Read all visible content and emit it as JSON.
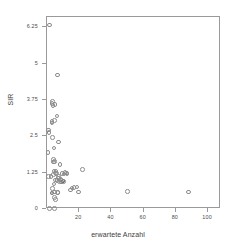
{
  "chart_data": {
    "type": "scatter",
    "title": "",
    "xlabel": "erwartete Anzahl",
    "ylabel": "SIR",
    "xlim": [
      0,
      108
    ],
    "ylim": [
      0,
      6.6
    ],
    "grid": false,
    "legend": null,
    "xticks": [
      20,
      40,
      60,
      80,
      100
    ],
    "yticks": [
      0,
      1.25,
      2.5,
      3.75,
      5,
      6.25
    ],
    "xtick_labels": [
      "20",
      "40",
      "60",
      "80",
      "100"
    ],
    "ytick_labels": [
      "0",
      "1.25",
      "2.5",
      "3.75",
      "5",
      "6.25"
    ],
    "marker": "open-circle",
    "marker_color": "#8c8c8c",
    "points": [
      {
        "x": 1.6,
        "y": 6.32,
        "emph": false
      },
      {
        "x": 1.0,
        "y": 2.72,
        "emph": false
      },
      {
        "x": 1.3,
        "y": 2.62,
        "emph": false
      },
      {
        "x": 0.6,
        "y": 1.95,
        "emph": false
      },
      {
        "x": 1.1,
        "y": 1.12,
        "emph": false
      },
      {
        "x": 2.6,
        "y": 1.12,
        "emph": false
      },
      {
        "x": 3.1,
        "y": 3.62,
        "emph": false
      },
      {
        "x": 3.4,
        "y": 3.7,
        "emph": false
      },
      {
        "x": 3.6,
        "y": 3.55,
        "emph": false
      },
      {
        "x": 3.0,
        "y": 3.0,
        "emph": false
      },
      {
        "x": 3.1,
        "y": 2.95,
        "emph": false
      },
      {
        "x": 5.0,
        "y": 3.6,
        "emph": false
      },
      {
        "x": 4.6,
        "y": 3.05,
        "emph": false
      },
      {
        "x": 3.3,
        "y": 2.45,
        "emph": false
      },
      {
        "x": 4.3,
        "y": 2.1,
        "emph": false
      },
      {
        "x": 4.1,
        "y": 1.7,
        "emph": false
      },
      {
        "x": 4.2,
        "y": 1.62,
        "emph": false
      },
      {
        "x": 4.7,
        "y": 1.64,
        "emph": false
      },
      {
        "x": 4.4,
        "y": 1.3,
        "emph": false
      },
      {
        "x": 4.2,
        "y": 1.18,
        "emph": false
      },
      {
        "x": 5.2,
        "y": 1.24,
        "emph": false
      },
      {
        "x": 5.6,
        "y": 1.3,
        "emph": false
      },
      {
        "x": 6.0,
        "y": 1.22,
        "emph": false
      },
      {
        "x": 5.4,
        "y": 1.0,
        "emph": false
      },
      {
        "x": 6.1,
        "y": 0.98,
        "emph": false
      },
      {
        "x": 4.3,
        "y": 0.86,
        "emph": false
      },
      {
        "x": 7.0,
        "y": 1.12,
        "emph": false
      },
      {
        "x": 7.3,
        "y": 1.06,
        "emph": false
      },
      {
        "x": 7.6,
        "y": 0.94,
        "emph": false
      },
      {
        "x": 8.3,
        "y": 1.02,
        "emph": false
      },
      {
        "x": 8.6,
        "y": 1.0,
        "emph": false
      },
      {
        "x": 9.0,
        "y": 0.93,
        "emph": false
      },
      {
        "x": 9.4,
        "y": 1.22,
        "emph": false
      },
      {
        "x": 10.6,
        "y": 1.2,
        "emph": false
      },
      {
        "x": 11.2,
        "y": 1.26,
        "emph": false
      },
      {
        "x": 12.0,
        "y": 1.24,
        "emph": false
      },
      {
        "x": 12.4,
        "y": 1.2,
        "emph": false
      },
      {
        "x": 10.0,
        "y": 0.96,
        "emph": true
      },
      {
        "x": 10.4,
        "y": 0.94,
        "emph": false
      },
      {
        "x": 8.0,
        "y": 1.52,
        "emph": false
      },
      {
        "x": 7.2,
        "y": 2.3,
        "emph": false
      },
      {
        "x": 6.6,
        "y": 4.6,
        "emph": false
      },
      {
        "x": 6.3,
        "y": 3.2,
        "emph": false
      },
      {
        "x": 22.0,
        "y": 1.36,
        "emph": false
      },
      {
        "x": 14.5,
        "y": 0.66,
        "emph": false
      },
      {
        "x": 15.5,
        "y": 0.72,
        "emph": false
      },
      {
        "x": 16.8,
        "y": 0.74,
        "emph": false
      },
      {
        "x": 18.6,
        "y": 0.76,
        "emph": false
      },
      {
        "x": 19.6,
        "y": 0.58,
        "emph": false
      },
      {
        "x": 3.4,
        "y": 0.7,
        "emph": false
      },
      {
        "x": 3.0,
        "y": 0.55,
        "emph": true
      },
      {
        "x": 3.2,
        "y": 0.55,
        "emph": false
      },
      {
        "x": 4.6,
        "y": 0.58,
        "emph": false
      },
      {
        "x": 6.4,
        "y": 0.56,
        "emph": false
      },
      {
        "x": 6.9,
        "y": 0.56,
        "emph": false
      },
      {
        "x": 4.6,
        "y": 0.4,
        "emph": false
      },
      {
        "x": 5.1,
        "y": 0.32,
        "emph": false
      },
      {
        "x": 50.0,
        "y": 0.6,
        "emph": false
      },
      {
        "x": 88.0,
        "y": 0.58,
        "emph": false
      },
      {
        "x": 1.5,
        "y": 0.02,
        "emph": false
      },
      {
        "x": 4.5,
        "y": 0.02,
        "emph": false
      }
    ]
  }
}
